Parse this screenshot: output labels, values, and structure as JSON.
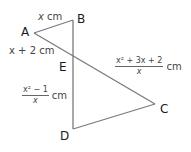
{
  "figure": {
    "line_color": "#7a7a7a",
    "vertices": {
      "A": "A",
      "B": "B",
      "C": "C",
      "D": "D",
      "E": "E"
    },
    "segments": {
      "AB": {
        "label_var": "x",
        "label_unit": " cm"
      },
      "AE": {
        "label": "x + 2 cm"
      },
      "EC": {
        "numerator": "x² + 3x + 2",
        "denominator": "x",
        "unit": "cm"
      },
      "ED": {
        "numerator": "x² − 1",
        "denominator": "x",
        "unit": "cm"
      }
    }
  }
}
